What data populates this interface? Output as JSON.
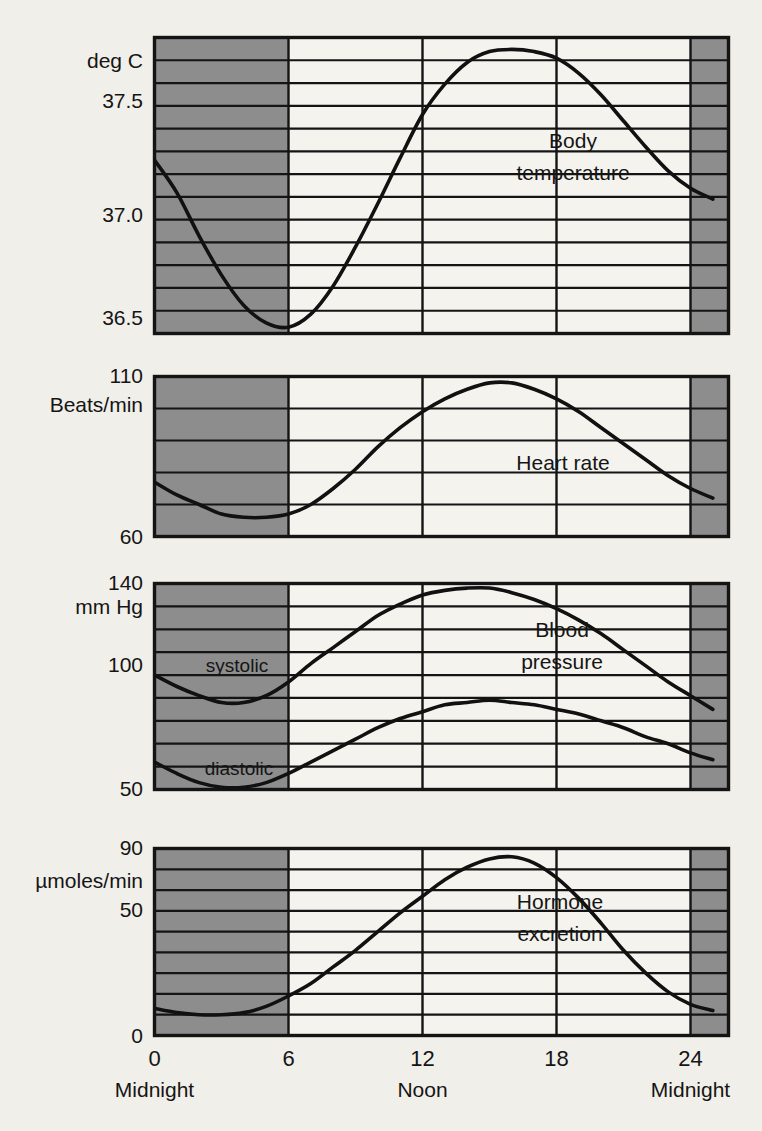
{
  "figure": {
    "background_color": "#f1efe9",
    "night_shading_color": "#8d8d8d",
    "day_color": "#f4f3ee",
    "line_color": "#111111",
    "grid_color": "#141414"
  },
  "x_axis": {
    "label": "",
    "ticks": [
      {
        "value": 0,
        "label": "0",
        "name": "Midnight"
      },
      {
        "value": 6,
        "label": "6",
        "name": ""
      },
      {
        "value": 12,
        "label": "12",
        "name": "Noon"
      },
      {
        "value": 18,
        "label": "18",
        "name": ""
      },
      {
        "value": 24,
        "label": "24",
        "name": "Midnight"
      }
    ],
    "range": [
      0,
      26.7
    ],
    "night_ranges": [
      [
        0,
        6
      ],
      [
        24,
        26.7
      ]
    ]
  },
  "panels": [
    {
      "id": "body-temperature",
      "series_label": "Body\ntemperature",
      "series_label_line1": "Body",
      "series_label_line2": "temperature",
      "unit_label": "deg C",
      "y_ticks": [
        {
          "value": 37.5,
          "label": "37.5"
        },
        {
          "value": 37.0,
          "label": "37.0"
        },
        {
          "value": 36.5,
          "label": "36.5"
        }
      ],
      "ylim": [
        36.37,
        37.78
      ],
      "gridline_count": 12
    },
    {
      "id": "heart-rate",
      "series_label": "Heart rate",
      "series_label_line1": "Heart rate",
      "series_label_line2": "",
      "unit_label": "Beats/min",
      "y_ticks": [
        {
          "value": 110,
          "label": "110"
        },
        {
          "value": 60,
          "label": "60"
        }
      ],
      "ylim": [
        60,
        110
      ],
      "gridline_count": 4
    },
    {
      "id": "blood-pressure",
      "series_label": "Blood\npressure",
      "series_label_line1": "Blood",
      "series_label_line2": "pressure",
      "unit_label": "mm Hg",
      "y_ticks": [
        {
          "value": 140,
          "label": "140"
        },
        {
          "value": 100,
          "label": "100"
        },
        {
          "value": 50,
          "label": "50"
        }
      ],
      "ylim": [
        50,
        140
      ],
      "gridline_count": 8,
      "inline_labels": [
        {
          "text": "systolic",
          "value": 100
        },
        {
          "text": "diastolic",
          "value": 62
        }
      ]
    },
    {
      "id": "hormone-excretion",
      "series_label": "Hormone\nexcretion",
      "series_label_line1": "Hormone",
      "series_label_line2": "excretion",
      "unit_label": "µmoles/min",
      "y_ticks": [
        {
          "value": 90,
          "label": "90"
        },
        {
          "value": 50,
          "label": "50"
        },
        {
          "value": 0,
          "label": "0"
        }
      ],
      "ylim": [
        0,
        90
      ],
      "gridline_count": 8
    }
  ],
  "chart_data": {
    "type": "line",
    "xlabel": "Time of day (hours)",
    "x": [
      0,
      1,
      2,
      3,
      4,
      5,
      6,
      7,
      8,
      9,
      10,
      11,
      12,
      13,
      14,
      15,
      16,
      17,
      18,
      19,
      20,
      21,
      22,
      23,
      24,
      25,
      26,
      26.7
    ],
    "xlim": [
      0,
      26.7
    ],
    "grid": true,
    "legend_position": "inline",
    "night_shading": [
      [
        0,
        6
      ],
      [
        24,
        26.7
      ]
    ],
    "subplots": [
      {
        "name": "Body temperature",
        "ylabel": "deg C",
        "ylim": [
          36.37,
          37.78
        ],
        "yticks": [
          36.5,
          37.0,
          37.5
        ],
        "series": [
          {
            "name": "Body temperature",
            "values": [
              37.23,
              37.08,
              36.88,
              36.7,
              36.56,
              36.48,
              36.46,
              36.52,
              36.65,
              36.83,
              37.03,
              37.24,
              37.44,
              37.58,
              37.68,
              37.73,
              37.74,
              37.73,
              37.7,
              37.63,
              37.53,
              37.41,
              37.29,
              37.18,
              37.1,
              37.05,
              37.02,
              37.02
            ]
          }
        ]
      },
      {
        "name": "Heart rate",
        "ylabel": "Beats/min",
        "ylim": [
          60,
          110
        ],
        "yticks": [
          60,
          110
        ],
        "series": [
          {
            "name": "Heart rate",
            "values": [
              77,
              73,
              70,
              67,
              66,
              66,
              67,
              70,
              75,
              81,
              88,
              94,
              99,
              103,
              106,
              108,
              108,
              106,
              103,
              99,
              94,
              89,
              84,
              79,
              75,
              72,
              69,
              68
            ]
          }
        ]
      },
      {
        "name": "Blood pressure",
        "ylabel": "mm Hg",
        "ylim": [
          50,
          140
        ],
        "yticks": [
          50,
          100,
          140
        ],
        "series": [
          {
            "name": "systolic",
            "values": [
              100,
              95,
              91,
              88,
              88,
              91,
              97,
              105,
              112,
              119,
              126,
              131,
              135,
              137,
              138,
              138,
              136,
              133,
              129,
              124,
              118,
              111,
              104,
              97,
              91,
              85,
              80,
              78
            ]
          },
          {
            "name": "diastolic",
            "values": [
              62,
              57,
              53,
              51,
              51,
              53,
              57,
              62,
              67,
              72,
              77,
              81,
              84,
              87,
              88,
              89,
              88,
              87,
              85,
              83,
              80,
              77,
              73,
              70,
              66,
              63,
              61,
              60
            ]
          }
        ]
      },
      {
        "name": "Hormone excretion",
        "ylabel": "µmoles/min",
        "ylim": [
          0,
          90
        ],
        "yticks": [
          0,
          50,
          90
        ],
        "series": [
          {
            "name": "Hormone excretion",
            "values": [
              13,
              11,
              10,
              10,
              11,
              14,
              19,
              25,
              33,
              41,
              50,
              59,
              67,
              75,
              81,
              85,
              86,
              83,
              76,
              66,
              54,
              41,
              30,
              21,
              15,
              12,
              11,
              11
            ]
          }
        ]
      }
    ]
  }
}
